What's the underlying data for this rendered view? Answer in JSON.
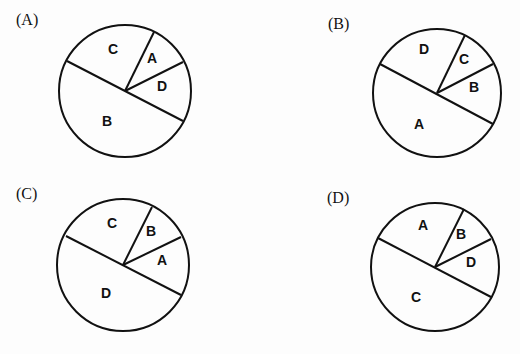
{
  "chart_data": [
    {
      "type": "pie",
      "option": "(A)",
      "center": [
        125,
        91
      ],
      "radius": 66,
      "slices": [
        {
          "label": "C",
          "pos": [
            113,
            50
          ]
        },
        {
          "label": "A",
          "pos": [
            152,
            59
          ]
        },
        {
          "label": "D",
          "pos": [
            162,
            87
          ]
        },
        {
          "label": "B",
          "pos": [
            107,
            122
          ]
        }
      ],
      "lines": [
        [
          67,
          61,
          183,
          121
        ],
        [
          125,
          91,
          154,
          32
        ],
        [
          125,
          91,
          183,
          62
        ]
      ]
    },
    {
      "type": "pie",
      "option": "(B)",
      "center": [
        437,
        93
      ],
      "radius": 64,
      "slices": [
        {
          "label": "D",
          "pos": [
            424,
            50
          ]
        },
        {
          "label": "C",
          "pos": [
            464,
            60
          ]
        },
        {
          "label": "B",
          "pos": [
            474,
            88
          ]
        },
        {
          "label": "A",
          "pos": [
            419,
            125
          ]
        }
      ],
      "lines": [
        [
          380,
          64,
          493,
          124
        ],
        [
          437,
          93,
          465,
          35
        ],
        [
          437,
          93,
          493,
          64
        ]
      ]
    },
    {
      "type": "pie",
      "option": "(C)",
      "center": [
        123,
        265
      ],
      "radius": 66,
      "slices": [
        {
          "label": "C",
          "pos": [
            112,
            224
          ]
        },
        {
          "label": "B",
          "pos": [
            151,
            232
          ]
        },
        {
          "label": "A",
          "pos": [
            162,
            261
          ]
        },
        {
          "label": "D",
          "pos": [
            106,
            294
          ]
        }
      ],
      "lines": [
        [
          66,
          236,
          181,
          295
        ],
        [
          123,
          265,
          152,
          207
        ],
        [
          123,
          265,
          181,
          237
        ]
      ]
    },
    {
      "type": "pie",
      "option": "(D)",
      "center": [
        435,
        267
      ],
      "radius": 64,
      "slices": [
        {
          "label": "A",
          "pos": [
            423,
            226
          ]
        },
        {
          "label": "B",
          "pos": [
            461,
            235
          ]
        },
        {
          "label": "D",
          "pos": [
            471,
            263
          ]
        },
        {
          "label": "C",
          "pos": [
            416,
            298
          ]
        }
      ],
      "lines": [
        [
          378,
          238,
          491,
          297
        ],
        [
          435,
          267,
          464,
          209
        ],
        [
          435,
          267,
          491,
          239
        ]
      ]
    }
  ],
  "labels": {
    "a": "(A)",
    "b": "(B)",
    "c": "(C)",
    "d": "(D)"
  }
}
